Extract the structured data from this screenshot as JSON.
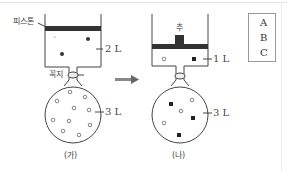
{
  "figure": {
    "panels": [
      {
        "id": "ga",
        "caption": "(가)",
        "piston_label": "피스톤",
        "valve_label": "꼭지",
        "cylinder_volume": "2 L",
        "flask_volume": "3 L",
        "cylinder_particles": {
          "A": 2,
          "B": 0,
          "C": 0
        },
        "flask_particles": {
          "A": 0,
          "B": 10,
          "C": 0
        }
      },
      {
        "id": "na",
        "caption": "(나)",
        "weight_label": "추",
        "cylinder_volume": "1 L",
        "flask_volume": "3 L",
        "cylinder_particles": {
          "A": 0,
          "B": 1,
          "C": 1
        },
        "flask_particles": {
          "A": 0,
          "B": 3,
          "C": 4
        }
      }
    ],
    "arrow": "process-arrow",
    "legend": [
      {
        "symbol": "filled-circle",
        "label": "A"
      },
      {
        "symbol": "open-circle",
        "label": "B"
      },
      {
        "symbol": "filled-square",
        "label": "C"
      }
    ],
    "colors": {
      "line": "#444444",
      "piston": "#333333",
      "arrow": "#777777",
      "particle_fill": "#222222"
    }
  }
}
